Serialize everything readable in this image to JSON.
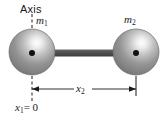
{
  "figure": {
    "background_color": "#ffffff",
    "width": 164,
    "height": 121
  },
  "labels": {
    "axis": "Axis",
    "mass_left": "m",
    "mass_left_sub": "1",
    "mass_right": "m",
    "mass_right_sub": "2",
    "distance": "x",
    "distance_sub": "2",
    "origin": "x",
    "origin_sub": "1",
    "origin_value": "= 0"
  },
  "elements": {
    "sphere_left": {
      "name": "mass-m1-sphere",
      "cx": 32,
      "cy": 52,
      "r": 23,
      "fill_base": "#8c8c8c",
      "fill_highlight": "#f2f2f2",
      "edge": "#5e5e5e",
      "center_dot_color": "#111111",
      "center_dot_r": 3
    },
    "sphere_right": {
      "name": "mass-m2-sphere",
      "cx": 136,
      "cy": 52,
      "r": 23,
      "fill_base": "#8c8c8c",
      "fill_highlight": "#f2f2f2",
      "edge": "#5e5e5e",
      "center_dot_color": "#111111",
      "center_dot_r": 3
    },
    "rod": {
      "name": "connecting-rod",
      "x1": 50,
      "x2": 120,
      "y": 53,
      "thickness": 7,
      "color": "#4a4a4a"
    },
    "axis_dashed_line": {
      "name": "rotation-axis-dashed-line",
      "x": 32,
      "y1": 14,
      "y2": 30,
      "color": "#1a1a1a"
    },
    "extension_left_dashed": {
      "name": "left-extension-dashed-line",
      "x": 32,
      "y1": 74,
      "y2": 102,
      "color": "#1a1a1a"
    },
    "extension_right_solid": {
      "name": "right-extension-line",
      "x": 136,
      "y1": 74,
      "y2": 96,
      "color": "#1a1a1a"
    },
    "dimension_line": {
      "name": "x2-dimension-line",
      "x1": 32,
      "x2": 136,
      "y": 89,
      "color": "#1a1a1a",
      "arrow_size": 4
    }
  },
  "colors": {
    "ink": "#1a1a1a",
    "rod": "#4a4a4a",
    "sphere": "#8c8c8c",
    "background": "#ffffff"
  }
}
